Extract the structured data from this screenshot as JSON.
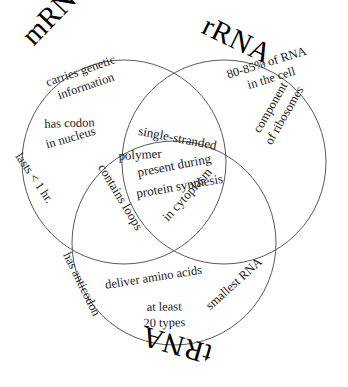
{
  "diagram": {
    "type": "venn-3set",
    "background_color": "#ffffff",
    "stroke_color": "#5a5a5a",
    "text_color": "#1a1a1a"
  },
  "sets": [
    {
      "id": "mrna",
      "title": "mRNA",
      "items": [
        "carries genetic\ninformation",
        "has codon",
        "in nucleus",
        "lasts < 1 hr."
      ]
    },
    {
      "id": "rrna",
      "title": "rRNA",
      "items": [
        "80-85% of RNA\nin the cell",
        "component\nof ribosomes"
      ]
    },
    {
      "id": "trna",
      "title": "tRNA",
      "items": [
        "has anticodon",
        "deliver amino acids",
        "at least\n20 types",
        "smallest RNA"
      ]
    }
  ],
  "intersection_all": {
    "items": [
      "single-stranded",
      "polymer",
      "present during",
      "protein synthesis",
      "contains loops",
      "in cytoplasm"
    ]
  },
  "labels": {
    "mrna_title": "mRNA",
    "rrna_title": "rRNA",
    "trna_title": "tRNA",
    "m_carries_1": "carries genetic",
    "m_carries_2": "information",
    "m_has_codon": "has codon",
    "m_in_nucleus": "in nucleus",
    "m_lasts": "lasts < 1 hr.",
    "r_percent_1": "80-85% of RNA",
    "r_percent_2": "in the cell",
    "r_component_1": "component",
    "r_component_2": "of ribosomes",
    "c_single_stranded": "single-stranded",
    "c_polymer": "polymer",
    "c_present_during": "present during",
    "c_protein_synthesis": "protein synthesis",
    "c_contains_loops": "contains loops",
    "c_in_cytoplasm": "in cytoplasm",
    "t_has_anticodon": "has anticodon",
    "t_deliver": "deliver amino acids",
    "t_at_least_1": "at least",
    "t_at_least_2": "20 types",
    "t_smallest_rna": "smallest RNA"
  }
}
